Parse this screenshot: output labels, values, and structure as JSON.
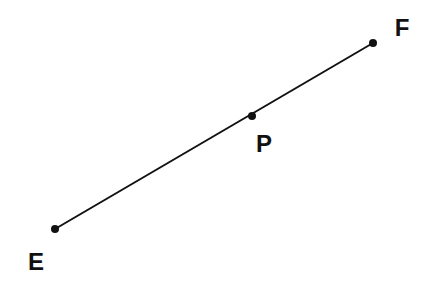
{
  "diagram": {
    "title": "",
    "colors": {
      "line": "#111111",
      "point": "#111111",
      "label": "#111111",
      "background": "#ffffff"
    },
    "points": [
      {
        "id": "E",
        "label": "E",
        "x": 55,
        "y": 229,
        "label_x": 36,
        "label_y": 270
      },
      {
        "id": "P",
        "label": "P",
        "x": 252,
        "y": 116,
        "label_x": 264,
        "label_y": 152
      },
      {
        "id": "F",
        "label": "F",
        "x": 373,
        "y": 43,
        "label_x": 402,
        "label_y": 36
      }
    ],
    "segments": [
      {
        "from": "E",
        "to": "F"
      }
    ],
    "relation": "P lies on segment EF"
  }
}
